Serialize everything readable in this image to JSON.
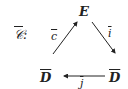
{
  "diagram": {
    "category_label": "𝒞",
    "category_suffix": ":",
    "nodes": {
      "top": "E",
      "bottom_left": "D",
      "bottom_right": "D"
    },
    "edges": {
      "left_to_top": "c",
      "top_to_right": "i",
      "right_to_left": "j"
    },
    "colors": {
      "ink": "#222222"
    }
  }
}
